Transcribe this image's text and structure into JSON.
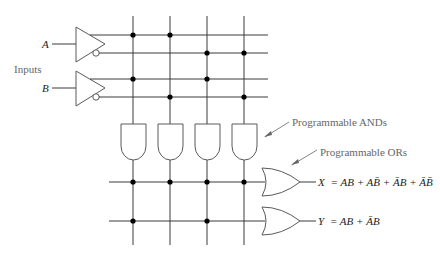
{
  "diagram": {
    "inputs_label": "Inputs",
    "inputs": [
      {
        "name": "A",
        "true_line_y": 35,
        "complement_line_y": 53
      },
      {
        "name": "B",
        "true_line_y": 79,
        "complement_line_y": 97
      }
    ],
    "product_columns_x": [
      133,
      170,
      207,
      244
    ],
    "and_connections": [
      {
        "row": "A",
        "columns": [
          0,
          1
        ]
      },
      {
        "row": "A'",
        "columns": [
          2,
          3
        ]
      },
      {
        "row": "B",
        "columns": [
          0,
          2
        ]
      },
      {
        "row": "B'",
        "columns": [
          1,
          3
        ]
      }
    ],
    "annotations": {
      "ands": "Programmable ANDs",
      "ors": "Programmable ORs"
    },
    "outputs": [
      {
        "name": "X",
        "equation_lhs": "X",
        "equation": "= AB + AB̄ + ĀB + ĀB̄",
        "row_y": 182,
        "columns": [
          0,
          1,
          2,
          3
        ]
      },
      {
        "name": "Y",
        "equation_lhs": "Y",
        "equation": "= AB + ĀB",
        "row_y": 221,
        "columns": [
          0,
          2
        ]
      }
    ],
    "colors": {
      "wire": "#3a3a3a",
      "gate": "#5a5a5a",
      "label": "#666666"
    }
  }
}
